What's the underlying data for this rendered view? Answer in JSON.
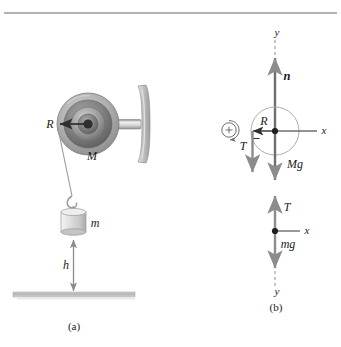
{
  "figure": {
    "type": "physics-free-body-diagram",
    "top_rule": true
  },
  "colors": {
    "rule": "#9a9a9a",
    "stroke_dark": "#333333",
    "arrow_gray": "#8c8c8c",
    "arrow_dark": "#4a4a4a",
    "pulley_outer": "#b5b5b5",
    "pulley_mid": "#8e8e8e",
    "pulley_inner": "#6e6e6e",
    "pulley_hub": "#3c3c3c",
    "shaft": "#d9d9d9",
    "wall": "#c2c2c2",
    "weight_body": "#dcdcdc",
    "ground": "#b9b9b9",
    "circle_outline": "#a9a9a9",
    "text": "#1a1a1a"
  },
  "panel_a": {
    "caption": "(a)",
    "labels": {
      "radius": "R",
      "pulley_mass": "M",
      "hanging_mass": "m",
      "height": "h"
    }
  },
  "panel_b": {
    "caption": "(b)",
    "pulley_fbd": {
      "axis_y": "y",
      "axis_x": "x",
      "normal_force": "n",
      "radius": "R",
      "tension": "T",
      "weight": "Mg",
      "rotation_sense": "+"
    },
    "mass_fbd": {
      "axis_x": "x",
      "axis_y": "y",
      "tension": "T",
      "weight": "mg"
    }
  }
}
